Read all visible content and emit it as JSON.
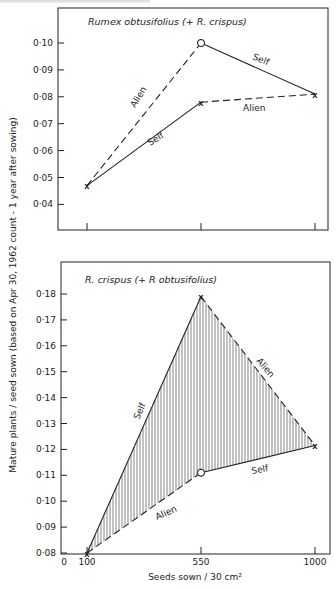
{
  "header": {
    "clipped_caption": ""
  },
  "chart_data": [
    {
      "type": "line",
      "title": "Rumex obtusifolius (+ R. crispus)",
      "xlabel": "Seeds sown / 30 cm²",
      "ylabel": "Mature plants / seed sown (based on Apr 30, 1962 count - 1 year after sowing)",
      "x": [
        100,
        550,
        1000
      ],
      "x_tick_labels": [],
      "y_ticks": [
        0.04,
        0.05,
        0.06,
        0.07,
        0.08,
        0.09,
        0.1
      ],
      "y_tick_labels": [
        "0·04",
        "0·05",
        "0·06",
        "0·07",
        "0·08",
        "0·09",
        "0·10"
      ],
      "ylim": [
        0.03,
        0.113
      ],
      "grid": false,
      "series": [
        {
          "name": "Alien",
          "style": "dashed",
          "segment": "100→550",
          "points": [
            [
              100,
              0.047
            ],
            [
              550,
              0.1
            ]
          ],
          "markers": [
            "x",
            "o"
          ]
        },
        {
          "name": "Self",
          "style": "solid",
          "segment": "100→550",
          "points": [
            [
              100,
              0.047
            ],
            [
              550,
              0.078
            ]
          ],
          "markers": [
            "x",
            "x"
          ]
        },
        {
          "name": "Self",
          "style": "solid",
          "segment": "550→1000",
          "points": [
            [
              550,
              0.1
            ],
            [
              1000,
              0.081
            ]
          ],
          "markers": [
            "o",
            "x"
          ]
        },
        {
          "name": "Alien",
          "style": "dashed",
          "segment": "550→1000",
          "points": [
            [
              550,
              0.078
            ],
            [
              1000,
              0.081
            ]
          ],
          "markers": [
            "x",
            "x"
          ]
        }
      ],
      "annotations": [
        "Alien",
        "Self",
        "Self",
        "Alien"
      ]
    },
    {
      "type": "line",
      "title": "R. crispus (+ R. obtusifolius)",
      "xlabel": "Seeds sown / 30 cm²",
      "ylabel": "Mature plants / seed sown (based on Apr 30, 1962 count - 1 year after sowing)",
      "x": [
        100,
        550,
        1000
      ],
      "x_ticks": [
        0,
        100,
        550,
        1000
      ],
      "x_tick_labels": [
        "0",
        "100",
        "550",
        "1000"
      ],
      "y_ticks": [
        0.08,
        0.09,
        0.1,
        0.11,
        0.12,
        0.13,
        0.14,
        0.15,
        0.16,
        0.17,
        0.18
      ],
      "y_tick_labels": [
        "0·08",
        "0·09",
        "0·10",
        "0·11",
        "0·12",
        "0·13",
        "0·14",
        "0·15",
        "0·16",
        "0·17",
        "0·18"
      ],
      "ylim": [
        0.08,
        0.19
      ],
      "grid": false,
      "shaded_region": "vertical hatching between Self and Alien polygon",
      "series": [
        {
          "name": "Self",
          "style": "solid",
          "segment": "100→550",
          "points": [
            [
              100,
              0.08
            ],
            [
              550,
              0.179
            ]
          ],
          "markers": [
            "x",
            "x"
          ]
        },
        {
          "name": "Alien",
          "style": "dashed",
          "segment": "550→1000",
          "points": [
            [
              550,
              0.179
            ],
            [
              1000,
              0.1215
            ]
          ],
          "markers": [
            "x",
            "x"
          ]
        },
        {
          "name": "Alien",
          "style": "dashed",
          "segment": "100→550",
          "points": [
            [
              100,
              0.08
            ],
            [
              550,
              0.111
            ]
          ],
          "markers": [
            "x",
            "o"
          ]
        },
        {
          "name": "Self",
          "style": "solid",
          "segment": "550→1000",
          "points": [
            [
              550,
              0.111
            ],
            [
              1000,
              0.1215
            ]
          ],
          "markers": [
            "o",
            "x"
          ]
        }
      ],
      "annotations": [
        "Self",
        "Alien",
        "Alien",
        "Self"
      ]
    }
  ],
  "labels": {
    "top_title": "Rumex  obtusifolius  (+ R. crispus)",
    "bottom_title": "R. crispus  (+ R obtusifolius)",
    "y_axis": "Mature plants / seed sown  (based on  Apr 30, 1962  count - 1 year  after sowing)",
    "x_axis": "Seeds sown / 30 cm²",
    "self": "Self",
    "alien": "Alien"
  }
}
